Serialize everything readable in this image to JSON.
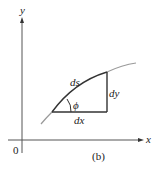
{
  "diagram": {
    "caption": "(b)",
    "axes": {
      "x_label": "x",
      "y_label": "y",
      "origin_label": "0"
    },
    "triangle": {
      "hypotenuse_label": "ds",
      "vertical_label": "dy",
      "horizontal_label": "dx",
      "angle_label": "ϕ"
    },
    "colors": {
      "axis": "#555555",
      "curve_light": "#9a9a9a",
      "curve_dark": "#333333",
      "triangle": "#333333"
    }
  }
}
